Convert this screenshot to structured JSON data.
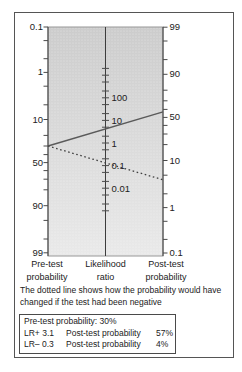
{
  "figure": {
    "caption": "The dotted line shows how the probability would have changed if the test had been negative",
    "axis_titles": {
      "left": [
        "Pre-test",
        "probability"
      ],
      "center": [
        "Likelihood",
        "ratio"
      ],
      "right": [
        "Post-test",
        "probability"
      ]
    },
    "results_box": {
      "line1": "Pre-test probability: 30%",
      "rows": [
        {
          "lr_label": "LR+ 3.1",
          "desc": "Post-test probability",
          "value": "57%"
        },
        {
          "lr_label": "LR– 0.3",
          "desc": "Post-test probability",
          "value": "4%"
        }
      ]
    }
  },
  "chart_data": {
    "type": "line",
    "subtype": "fagan-nomogram",
    "title": "",
    "axes": {
      "left": {
        "title": "Pre-test probability",
        "scale": "log-odds",
        "top_value": "0.1",
        "bottom_value": "99",
        "labeled_ticks": [
          "0.1",
          "1",
          "10",
          "50",
          "90",
          "99"
        ]
      },
      "center": {
        "title": "Likelihood ratio",
        "scale": "log",
        "labeled_ticks": [
          "100",
          "10",
          "1",
          "0.1",
          "0.01"
        ]
      },
      "right": {
        "title": "Post-test probability",
        "scale": "log-odds",
        "top_value": "99",
        "bottom_value": "0.1",
        "labeled_ticks": [
          "99",
          "90",
          "50",
          "10",
          "1",
          "0.1"
        ]
      }
    },
    "series": [
      {
        "name": "positive test result",
        "line_style": "solid",
        "pre_test_probability_pct": 30,
        "likelihood_ratio": 3.1,
        "post_test_probability_pct": 57
      },
      {
        "name": "negative test result",
        "line_style": "dotted",
        "pre_test_probability_pct": 30,
        "likelihood_ratio": 0.3,
        "post_test_probability_pct": 4
      }
    ]
  },
  "colors": {
    "plot_fill_top": "#cccccc",
    "plot_fill_bottom": "#e9e9e9",
    "plot_border": "#979797",
    "axis": "#3d3d3d",
    "tick": "#4a4a4a",
    "solid_line": "#5a5a5a",
    "dotted_line": "#3f3f3f",
    "text": "#222222",
    "frame_border": "#555555"
  }
}
